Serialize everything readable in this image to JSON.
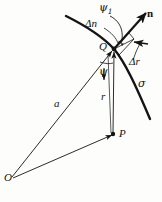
{
  "figure": {
    "kind": "geometry-diagram",
    "background_color": "#fdfdfc",
    "ink_color": "#141414",
    "points": [
      {
        "id": "O",
        "label": "O",
        "x": 12,
        "y": 178,
        "label_x": 5,
        "label_y": 180,
        "marker": "none"
      },
      {
        "id": "P",
        "label": "P",
        "x": 113,
        "y": 134,
        "label_x": 118,
        "label_y": 136,
        "marker": "dot"
      },
      {
        "id": "Q",
        "label": "Q",
        "x": 114,
        "y": 49,
        "label_x": 97,
        "label_y": 49,
        "marker": "dot"
      }
    ],
    "labels": [
      {
        "id": "psi-1",
        "text": "ψ",
        "sub": "1",
        "x": 101,
        "y": 8,
        "bold": false
      },
      {
        "id": "delta-n",
        "text": "Δn",
        "sub": "",
        "x": 90,
        "y": 24,
        "bold": false
      },
      {
        "id": "delta-r",
        "text": "Δr",
        "sub": "",
        "x": 133,
        "y": 62,
        "bold": false
      },
      {
        "id": "n-vector",
        "text": "n",
        "sub": "",
        "x": 148,
        "y": 14,
        "bold": true
      },
      {
        "id": "sigma",
        "text": "σ",
        "sub": "",
        "x": 141,
        "y": 84,
        "bold": false
      },
      {
        "id": "psi",
        "text": "ψ",
        "sub": "",
        "x": 100,
        "y": 72,
        "bold": false
      },
      {
        "id": "r",
        "text": "r",
        "sub": "",
        "x": 103,
        "y": 96,
        "bold": false
      },
      {
        "id": "a",
        "text": "a",
        "sub": "",
        "x": 57,
        "y": 104,
        "bold": false
      }
    ],
    "segments": [
      {
        "id": "a-vector",
        "from": "O",
        "to": "Q",
        "arrow": "end",
        "weight": 0.9
      },
      {
        "id": "r-vector",
        "from": "P",
        "to": "Q",
        "arrow": "end",
        "weight": 0.9
      },
      {
        "id": "op-vector",
        "from": "O",
        "to": "P",
        "arrow": "end",
        "weight": 0.9
      },
      {
        "id": "normal-vector",
        "from": "Q",
        "to": "n-tip",
        "arrow": "end",
        "weight": 2.1
      }
    ],
    "curves": [
      {
        "id": "sigma-curve",
        "name": "curve-sigma",
        "weight": 2.3
      },
      {
        "id": "psi1-arc",
        "name": "angle-arc-psi1",
        "weight": 0.8
      },
      {
        "id": "psi-arc",
        "name": "angle-arc-psi",
        "weight": 0.8
      },
      {
        "id": "leader-delta-n",
        "name": "leader-line-delta-n",
        "weight": 0.8
      },
      {
        "id": "leader-delta-r",
        "name": "leader-line-delta-r",
        "weight": 0.8
      }
    ]
  }
}
